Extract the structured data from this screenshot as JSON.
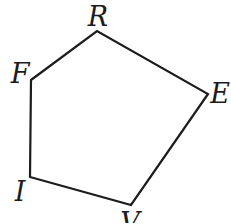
{
  "figure": {
    "type": "geometric-diagram",
    "shape": "pentagon",
    "background": "#ffffff",
    "stroke_color": "#1c1c1c",
    "stroke_width": 2.2,
    "label_color": "#1c1c1c",
    "vertex_order": [
      "F",
      "R",
      "E",
      "V",
      "I"
    ],
    "vertices": [
      {
        "label": "R",
        "x": 97,
        "y": 31,
        "label_x": 98,
        "label_y": 16
      },
      {
        "label": "F",
        "x": 31,
        "y": 80,
        "label_x": 20,
        "label_y": 73
      },
      {
        "label": "E",
        "x": 208,
        "y": 94,
        "label_x": 220,
        "label_y": 93
      },
      {
        "label": "V",
        "x": 131,
        "y": 205,
        "label_x": 130,
        "label_y": 222
      },
      {
        "label": "I",
        "x": 30,
        "y": 177,
        "label_x": 20,
        "label_y": 191
      }
    ],
    "edges": [
      [
        "F",
        "R"
      ],
      [
        "R",
        "E"
      ],
      [
        "E",
        "V"
      ],
      [
        "V",
        "I"
      ],
      [
        "I",
        "F"
      ]
    ]
  }
}
